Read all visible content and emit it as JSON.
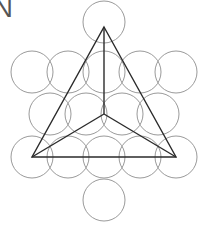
{
  "figure": {
    "label_text": "N",
    "canvas": {
      "width": 206,
      "height": 237,
      "background": "#ffffff"
    },
    "colors": {
      "circle_stroke": "#9a9a9a",
      "line_stroke": "#2b2b2b",
      "label_color": "#555555",
      "background": "#ffffff"
    },
    "circle_radius": 21,
    "circles": [
      {
        "name": "circle-top",
        "cx": 104,
        "cy": 22,
        "r": 21
      },
      {
        "name": "circle-upper-left",
        "cx": 32,
        "cy": 72,
        "r": 21
      },
      {
        "name": "circle-row2-left",
        "cx": 68,
        "cy": 72,
        "r": 21
      },
      {
        "name": "circle-row2-center",
        "cx": 104,
        "cy": 72,
        "r": 21
      },
      {
        "name": "circle-row2-right",
        "cx": 140,
        "cy": 72,
        "r": 21
      },
      {
        "name": "circle-upper-right",
        "cx": 176,
        "cy": 72,
        "r": 21
      },
      {
        "name": "circle-row3-left",
        "cx": 50,
        "cy": 114,
        "r": 21
      },
      {
        "name": "circle-row3-midleft",
        "cx": 86,
        "cy": 114,
        "r": 21
      },
      {
        "name": "circle-row3-midright",
        "cx": 122,
        "cy": 114,
        "r": 21
      },
      {
        "name": "circle-row3-right",
        "cx": 158,
        "cy": 114,
        "r": 21
      },
      {
        "name": "circle-row4-far-left",
        "cx": 32,
        "cy": 157,
        "r": 21
      },
      {
        "name": "circle-row4-left",
        "cx": 68,
        "cy": 157,
        "r": 21
      },
      {
        "name": "circle-row4-center",
        "cx": 104,
        "cy": 157,
        "r": 21
      },
      {
        "name": "circle-row4-right",
        "cx": 140,
        "cy": 157,
        "r": 21
      },
      {
        "name": "circle-row4-far-right",
        "cx": 176,
        "cy": 157,
        "r": 21
      },
      {
        "name": "circle-bottom",
        "cx": 104,
        "cy": 200,
        "r": 21
      }
    ],
    "triangle": {
      "name": "outer-triangle",
      "points": "104,27 176,157 32,157",
      "vertices": [
        {
          "name": "apex",
          "x": 104,
          "y": 27
        },
        {
          "name": "bottom-right",
          "x": 176,
          "y": 157
        },
        {
          "name": "bottom-left",
          "x": 32,
          "y": 157
        }
      ]
    },
    "center_point": {
      "name": "centroid",
      "x": 104,
      "y": 114
    },
    "spokes": [
      {
        "name": "spoke-to-apex",
        "x1": 104,
        "y1": 114,
        "x2": 104,
        "y2": 27
      },
      {
        "name": "spoke-to-bottom-left",
        "x1": 104,
        "y1": 114,
        "x2": 32,
        "y2": 157
      },
      {
        "name": "spoke-to-bottom-right",
        "x1": 104,
        "y1": 114,
        "x2": 176,
        "y2": 157
      }
    ]
  }
}
